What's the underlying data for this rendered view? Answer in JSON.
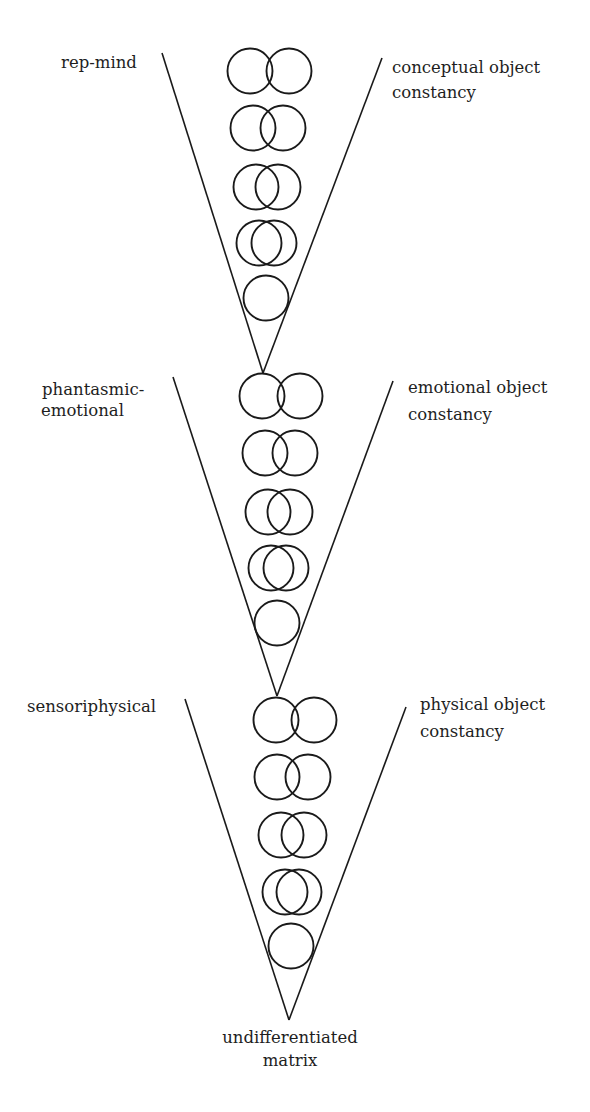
{
  "diagram": {
    "type": "stacked-V developmental levels",
    "stroke_color": "#1a1a1a",
    "background": "#ffffff",
    "levels": [
      {
        "id": "level-1",
        "left_label": [
          "rep-mind"
        ],
        "right_label": [
          "conceptual object",
          "constancy"
        ],
        "v_left_top": [
          162,
          53
        ],
        "v_right_top": [
          382,
          58
        ],
        "apex": [
          263,
          373
        ],
        "circle_rows": [
          {
            "cy": 71,
            "centers": [
              250,
              289
            ]
          },
          {
            "cy": 128,
            "centers": [
              253,
              283
            ]
          },
          {
            "cy": 187,
            "centers": [
              256,
              278
            ]
          },
          {
            "cy": 243,
            "centers": [
              259,
              274
            ]
          },
          {
            "cy": 298,
            "centers": [
              266
            ]
          }
        ]
      },
      {
        "id": "level-2",
        "left_label": [
          "phantasmic-",
          "emotional"
        ],
        "right_label": [
          "emotional object",
          "constancy"
        ],
        "v_left_top": [
          173,
          377
        ],
        "v_right_top": [
          393,
          381
        ],
        "apex": [
          277,
          696
        ],
        "circle_rows": [
          {
            "cy": 396,
            "centers": [
              262,
              300
            ]
          },
          {
            "cy": 453,
            "centers": [
              265,
              295
            ]
          },
          {
            "cy": 512,
            "centers": [
              268,
              290
            ]
          },
          {
            "cy": 568,
            "centers": [
              271,
              286
            ]
          },
          {
            "cy": 623,
            "centers": [
              277
            ]
          }
        ]
      },
      {
        "id": "level-3",
        "left_label": [
          "sensoriphysical"
        ],
        "right_label": [
          "physical object",
          "constancy"
        ],
        "v_left_top": [
          185,
          699
        ],
        "v_right_top": [
          406,
          707
        ],
        "apex": [
          289,
          1020
        ],
        "circle_rows": [
          {
            "cy": 720,
            "centers": [
              276,
              314
            ]
          },
          {
            "cy": 777,
            "centers": [
              277,
              308
            ]
          },
          {
            "cy": 835,
            "centers": [
              281,
              304
            ]
          },
          {
            "cy": 892,
            "centers": [
              285,
              299
            ]
          },
          {
            "cy": 946,
            "centers": [
              291
            ]
          }
        ]
      }
    ],
    "circle_radius": 22.5,
    "bottom_label": [
      "undifferentiated",
      "matrix"
    ]
  }
}
